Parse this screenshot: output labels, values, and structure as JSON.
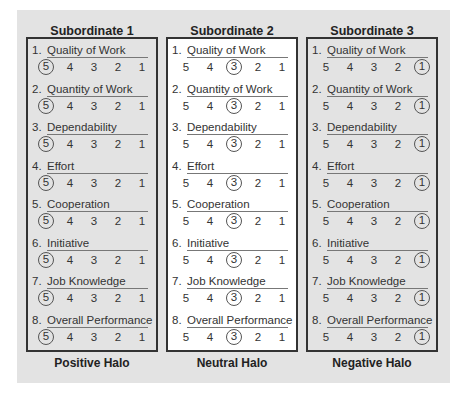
{
  "items": [
    "Quality of Work",
    "Quantity of Work",
    "Dependability",
    "Effort",
    "Cooperation",
    "Initiative",
    "Job Knowledge",
    "Overall Performance"
  ],
  "scale": [
    5,
    4,
    3,
    2,
    1
  ],
  "columns": [
    {
      "title": "Subordinate 1",
      "footer": "Positive Halo",
      "selected": 5,
      "background": "gray"
    },
    {
      "title": "Subordinate 2",
      "footer": "Neutral Halo",
      "selected": 3,
      "background": "white"
    },
    {
      "title": "Subordinate 3",
      "footer": "Negative Halo",
      "selected": 1,
      "background": "gray"
    }
  ]
}
